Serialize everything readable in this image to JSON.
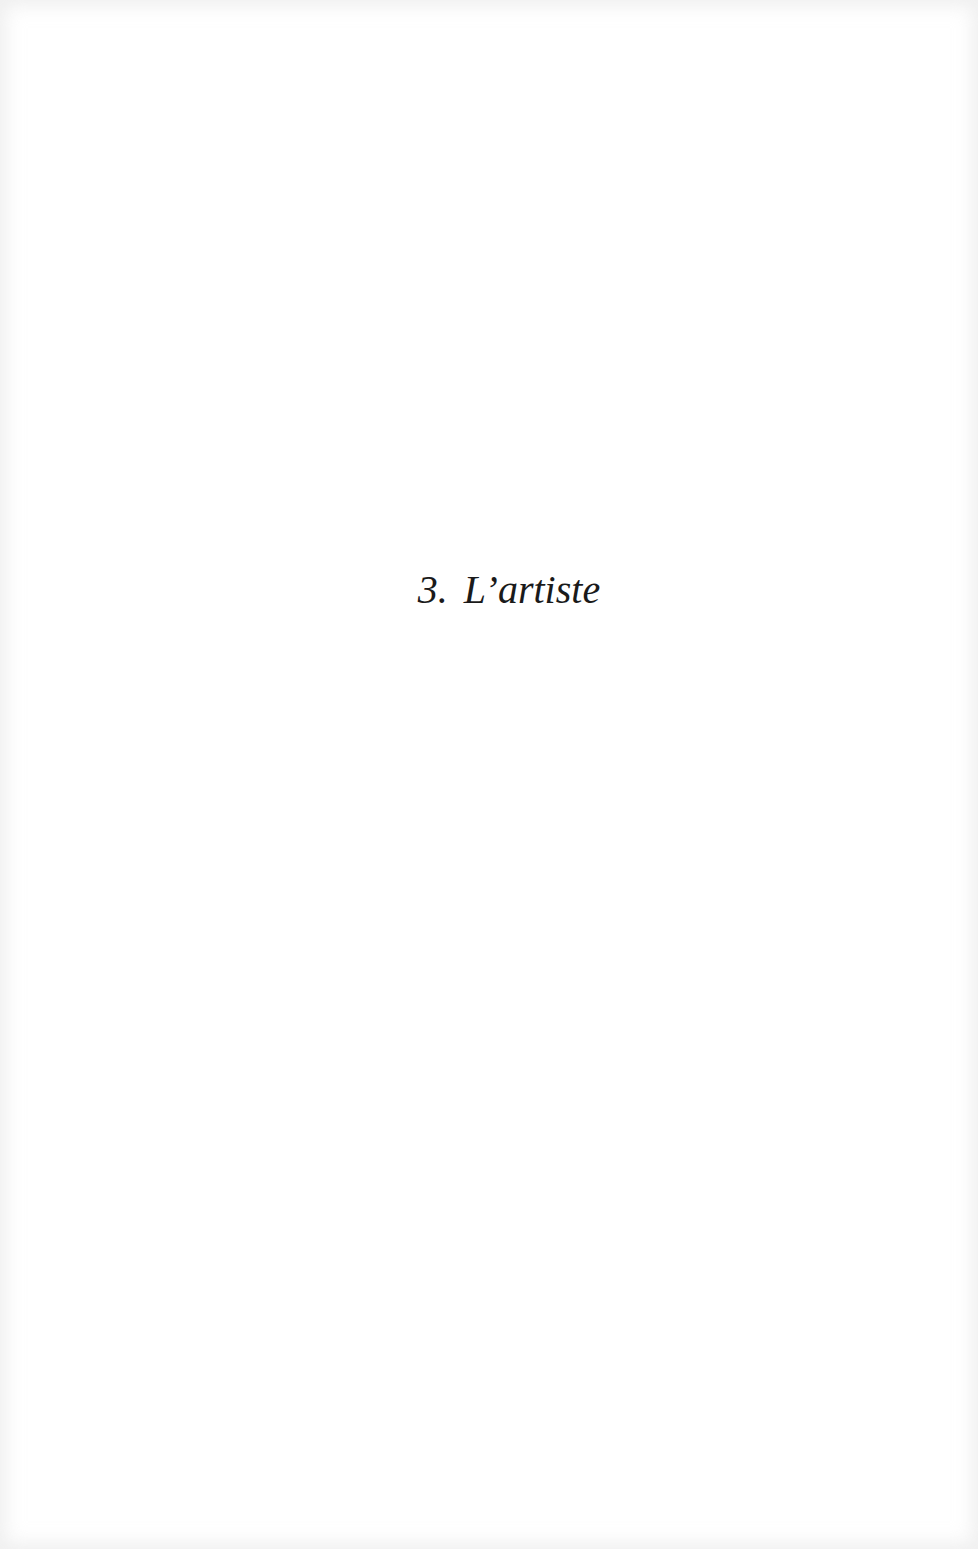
{
  "page": {
    "background_color": "#ffffff",
    "text_color": "#1a1a1a"
  },
  "chapter": {
    "number": "3.",
    "title": "L’artiste"
  }
}
